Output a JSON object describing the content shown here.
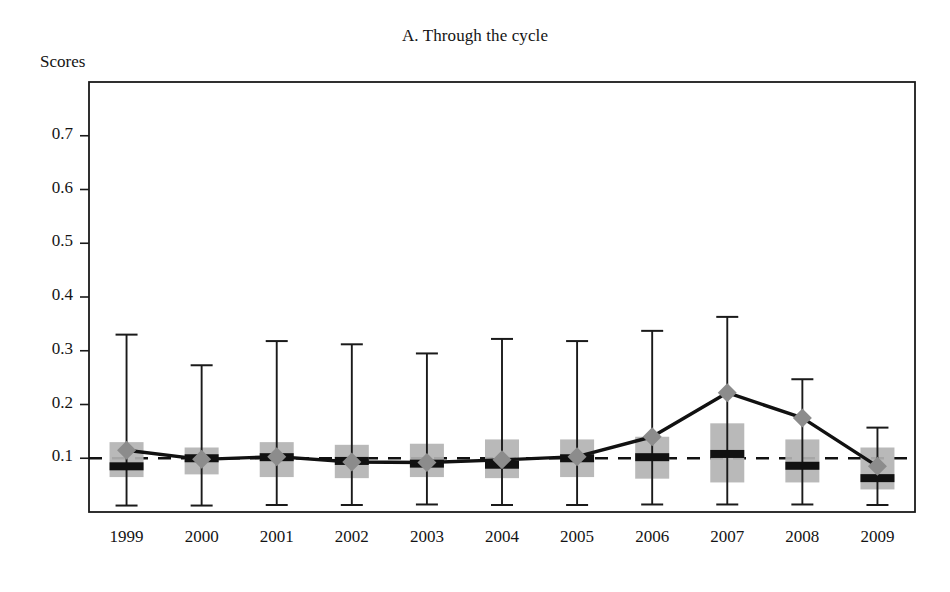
{
  "figure": {
    "title": "A. Through the cycle",
    "y_axis_title": "Scores"
  },
  "axis": {
    "y_ticks": [
      "0.1",
      "0.2",
      "0.3",
      "0.4",
      "0.5",
      "0.6",
      "0.7"
    ],
    "x_ticks": [
      "1999",
      "2000",
      "2001",
      "2002",
      "2003",
      "2004",
      "2005",
      "2006",
      "2007",
      "2008",
      "2009"
    ]
  },
  "colors": {
    "box_fill": "#b3b3b3",
    "marker": "#8c8c8c",
    "line": "#111111",
    "axis": "#1a1a1a",
    "reference_line": "#111111",
    "median": "#111111",
    "background": "#ffffff"
  },
  "chart_data": {
    "type": "box",
    "title": "A. Through the cycle",
    "xlabel": "",
    "ylabel": "Scores",
    "ylim": [
      0.0,
      0.8
    ],
    "xlim_categories": [
      "1999",
      "2000",
      "2001",
      "2002",
      "2003",
      "2004",
      "2005",
      "2006",
      "2007",
      "2008",
      "2009"
    ],
    "ytick_values": [
      0.1,
      0.2,
      0.3,
      0.4,
      0.5,
      0.6,
      0.7
    ],
    "grid": false,
    "legend": "none",
    "reference_line": {
      "value": 0.1,
      "style": "dashed",
      "label": ""
    },
    "categories": [
      "1999",
      "2000",
      "2001",
      "2002",
      "2003",
      "2004",
      "2005",
      "2006",
      "2007",
      "2008",
      "2009"
    ],
    "boxes": [
      {
        "year": "1999",
        "whisker_low": 0.012,
        "q1": 0.065,
        "median": 0.085,
        "q3": 0.13,
        "whisker_high": 0.33
      },
      {
        "year": "2000",
        "whisker_low": 0.012,
        "q1": 0.07,
        "median": 0.1,
        "q3": 0.12,
        "whisker_high": 0.273
      },
      {
        "year": "2001",
        "whisker_low": 0.013,
        "q1": 0.065,
        "median": 0.102,
        "q3": 0.13,
        "whisker_high": 0.318
      },
      {
        "year": "2002",
        "whisker_low": 0.013,
        "q1": 0.063,
        "median": 0.095,
        "q3": 0.125,
        "whisker_high": 0.312
      },
      {
        "year": "2003",
        "whisker_low": 0.014,
        "q1": 0.065,
        "median": 0.09,
        "q3": 0.127,
        "whisker_high": 0.295
      },
      {
        "year": "2004",
        "whisker_low": 0.013,
        "q1": 0.063,
        "median": 0.088,
        "q3": 0.135,
        "whisker_high": 0.322
      },
      {
        "year": "2005",
        "whisker_low": 0.013,
        "q1": 0.065,
        "median": 0.1,
        "q3": 0.135,
        "whisker_high": 0.318
      },
      {
        "year": "2006",
        "whisker_low": 0.014,
        "q1": 0.062,
        "median": 0.102,
        "q3": 0.14,
        "whisker_high": 0.337
      },
      {
        "year": "2007",
        "whisker_low": 0.014,
        "q1": 0.055,
        "median": 0.108,
        "q3": 0.165,
        "whisker_high": 0.363
      },
      {
        "year": "2008",
        "whisker_low": 0.014,
        "q1": 0.055,
        "median": 0.086,
        "q3": 0.135,
        "whisker_high": 0.247
      },
      {
        "year": "2009",
        "whisker_low": 0.013,
        "q1": 0.042,
        "median": 0.063,
        "q3": 0.12,
        "whisker_high": 0.157
      }
    ],
    "series": [
      {
        "name": "mean",
        "marker": "diamond",
        "values": [
          0.115,
          0.098,
          0.103,
          0.093,
          0.092,
          0.097,
          0.103,
          0.14,
          0.222,
          0.175,
          0.085
        ]
      }
    ]
  }
}
